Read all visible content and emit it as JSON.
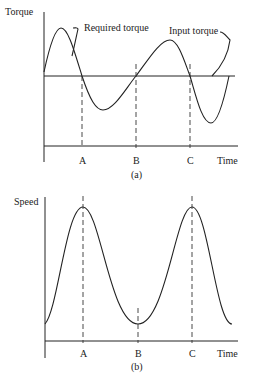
{
  "figure_a": {
    "y_label": "Torque",
    "x_label": "Time",
    "caption": "(a)",
    "annotations": [
      "Required torque",
      "Input torque"
    ],
    "markers": [
      "A",
      "B",
      "C"
    ]
  },
  "figure_b": {
    "y_label": "Speed",
    "x_label": "Time",
    "caption": "(b)",
    "markers": [
      "A",
      "B",
      "C"
    ]
  },
  "colors": {
    "line": "#222222",
    "background": "#ffffff"
  }
}
